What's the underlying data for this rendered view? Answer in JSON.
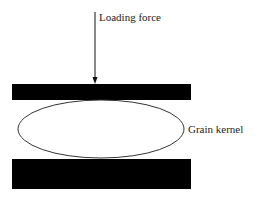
{
  "diagram": {
    "type": "compression-test-schematic",
    "labels": {
      "force": "Loading force",
      "kernel": "Grain kernel"
    },
    "elements": {
      "force_arrow": {
        "direction": "down",
        "x": 95,
        "y_start": 12,
        "y_end": 84
      },
      "top_plate": {
        "x": 12,
        "y": 84,
        "width": 179,
        "height": 16,
        "color": "#000000"
      },
      "kernel": {
        "cx": 101,
        "cy": 129,
        "rx": 83,
        "ry": 29,
        "stroke": "#333333",
        "fill": "#ffffff"
      },
      "bottom_plate": {
        "x": 12,
        "y": 159,
        "width": 179,
        "height": 30,
        "color": "#000000"
      }
    }
  }
}
